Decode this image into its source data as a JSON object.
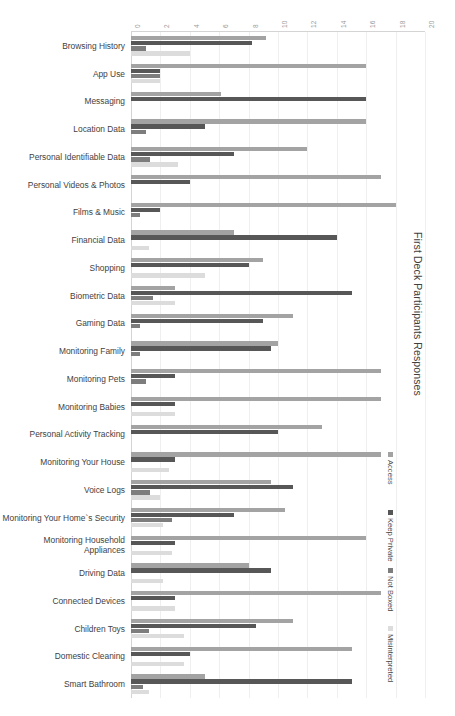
{
  "chart_data": {
    "type": "bar",
    "orientation": "horizontal",
    "title": "First Deck Participants Responses",
    "xlabel": "",
    "ylabel": "",
    "xlim": [
      0,
      20
    ],
    "grid": true,
    "legend_position": "right",
    "tick_labels": [
      "0",
      "2",
      "4",
      "6",
      "8",
      "10",
      "12",
      "14",
      "16",
      "18",
      "20"
    ],
    "categories": [
      "Browsing History",
      "App Use",
      "Messaging",
      "Location Data",
      "Personal Identifiable Data",
      "Personal Videos & Photos",
      "Films & Music",
      "Financial Data",
      "Shopping",
      "Biometric Data",
      "Gaming Data",
      "Monitoring Family",
      "Monitoring Pets",
      "Monitoring Babies",
      "Personal Activity Tracking",
      "Monitoring Your House",
      "Voice Logs",
      "Monitoring Your Home`s Security",
      "Monitoring Household Appliances",
      "Driving Data",
      "Connected Devices",
      "Children Toys",
      "Domestic Cleaning",
      "Smart Bathroom"
    ],
    "series": [
      {
        "name": "Access",
        "color": "#a3a3a3",
        "values": [
          9.2,
          16.0,
          6.1,
          16.0,
          12.0,
          17.0,
          18.0,
          7.0,
          9.0,
          3.0,
          11.0,
          10.0,
          17.0,
          17.0,
          13.0,
          17.0,
          9.5,
          10.5,
          16.0,
          8.0,
          17.0,
          11.0,
          15.0,
          5.0
        ]
      },
      {
        "name": "Keep Private",
        "color": "#575757",
        "values": [
          8.2,
          2.0,
          16.0,
          5.0,
          7.0,
          4.0,
          2.0,
          14.0,
          8.0,
          15.0,
          9.0,
          9.5,
          3.0,
          3.0,
          10.0,
          3.0,
          11.0,
          7.0,
          3.0,
          9.5,
          3.0,
          8.5,
          4.0,
          15.0
        ]
      },
      {
        "name": "Not Boxed",
        "color": "#7d7d7d",
        "values": [
          1.0,
          2.0,
          0.0,
          1.0,
          1.3,
          0.0,
          0.6,
          0.0,
          0.0,
          1.5,
          0.6,
          0.6,
          1.0,
          0.0,
          0.0,
          0.0,
          1.3,
          2.8,
          0.0,
          0.0,
          0.0,
          1.2,
          0.0,
          0.8
        ]
      },
      {
        "name": "Misinterpreted",
        "color": "#dcdcdc",
        "values": [
          4.0,
          2.0,
          0.0,
          0.0,
          3.2,
          0.0,
          0.0,
          1.2,
          5.0,
          3.0,
          0.0,
          0.0,
          0.0,
          3.0,
          0.0,
          2.6,
          2.0,
          2.2,
          2.8,
          2.2,
          3.0,
          3.6,
          3.6,
          1.2
        ]
      }
    ]
  },
  "legend": {
    "items": [
      {
        "label": "Access",
        "color": "#a3a3a3"
      },
      {
        "label": "Keep Private",
        "color": "#575757"
      },
      {
        "label": "Not Boxed",
        "color": "#7d7d7d"
      },
      {
        "label": "Misinterpreted",
        "color": "#dcdcdc"
      }
    ]
  }
}
